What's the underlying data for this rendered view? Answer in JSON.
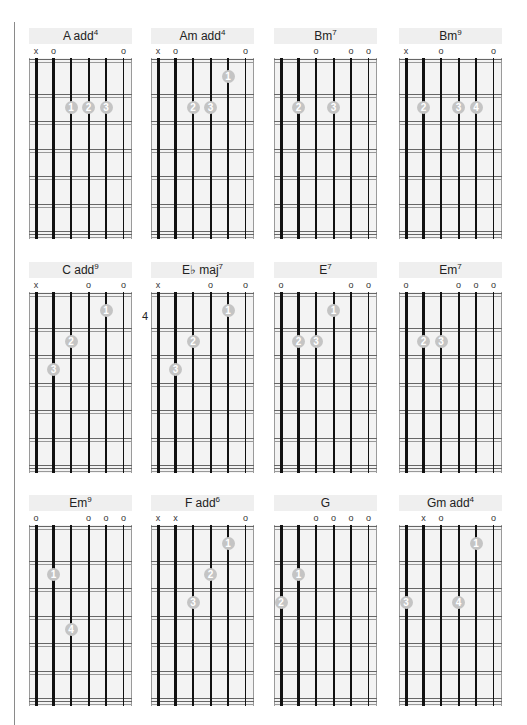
{
  "page": {
    "layout": {
      "cols_x": [
        29,
        151,
        274,
        399
      ],
      "rows_y": [
        28,
        262,
        495
      ]
    },
    "colors": {
      "board": "#f3f3f3",
      "title_bg": "#efefef",
      "dot": "#c4c4c4",
      "string": "#111111"
    }
  },
  "chords": [
    {
      "name": "A add",
      "sup": "4",
      "markers": [
        "x",
        "o",
        "",
        "",
        "",
        "o"
      ],
      "dots": [
        {
          "s": 2,
          "f": 2,
          "n": "1"
        },
        {
          "s": 3,
          "f": 2,
          "n": "2"
        },
        {
          "s": 4,
          "f": 2,
          "n": "3"
        }
      ]
    },
    {
      "name": "Am add",
      "sup": "4",
      "markers": [
        "x",
        "o",
        "",
        "",
        "",
        "o"
      ],
      "dots": [
        {
          "s": 4,
          "f": 1,
          "n": "1"
        },
        {
          "s": 2,
          "f": 2,
          "n": "2"
        },
        {
          "s": 3,
          "f": 2,
          "n": "3"
        }
      ]
    },
    {
      "name": "Bm",
      "sup": "7",
      "markers": [
        "",
        "",
        "o",
        "",
        "o",
        "o"
      ],
      "dots": [
        {
          "s": 1,
          "f": 2,
          "n": "2"
        },
        {
          "s": 3,
          "f": 2,
          "n": "3"
        }
      ]
    },
    {
      "name": "Bm",
      "sup": "9",
      "markers": [
        "x",
        "",
        "o",
        "",
        "",
        "o"
      ],
      "dots": [
        {
          "s": 1,
          "f": 2,
          "n": "2"
        },
        {
          "s": 3,
          "f": 2,
          "n": "3"
        },
        {
          "s": 4,
          "f": 2,
          "n": "4"
        }
      ]
    },
    {
      "name": "C add",
      "sup": "9",
      "markers": [
        "x",
        "",
        "",
        "o",
        "",
        "o"
      ],
      "dots": [
        {
          "s": 4,
          "f": 1,
          "n": "1"
        },
        {
          "s": 2,
          "f": 2,
          "n": "2"
        },
        {
          "s": 1,
          "f": 3,
          "n": "3"
        }
      ]
    },
    {
      "name": "E♭ maj",
      "sup": "7",
      "position": "4",
      "markers": [
        "x",
        "",
        "",
        "o",
        "",
        "o"
      ],
      "dots": [
        {
          "s": 4,
          "f": 1,
          "n": "1"
        },
        {
          "s": 2,
          "f": 2,
          "n": "2"
        },
        {
          "s": 1,
          "f": 3,
          "n": "3"
        }
      ]
    },
    {
      "name": "E",
      "sup": "7",
      "markers": [
        "o",
        "",
        "",
        "",
        "o",
        "o"
      ],
      "dots": [
        {
          "s": 3,
          "f": 1,
          "n": "1"
        },
        {
          "s": 1,
          "f": 2,
          "n": "2"
        },
        {
          "s": 2,
          "f": 2,
          "n": "3"
        }
      ]
    },
    {
      "name": "Em",
      "sup": "7",
      "markers": [
        "o",
        "",
        "",
        "o",
        "o",
        "o"
      ],
      "dots": [
        {
          "s": 1,
          "f": 2,
          "n": "2"
        },
        {
          "s": 2,
          "f": 2,
          "n": "3"
        }
      ]
    },
    {
      "name": "Em",
      "sup": "9",
      "markers": [
        "o",
        "",
        "",
        "o",
        "o",
        "o"
      ],
      "dots": [
        {
          "s": 1,
          "f": 2,
          "n": "1"
        },
        {
          "s": 2,
          "f": 4,
          "n": "4"
        }
      ]
    },
    {
      "name": "F add",
      "sup": "6",
      "markers": [
        "x",
        "x",
        "",
        "",
        "",
        "o"
      ],
      "dots": [
        {
          "s": 4,
          "f": 1,
          "n": "1"
        },
        {
          "s": 3,
          "f": 2,
          "n": "2"
        },
        {
          "s": 2,
          "f": 3,
          "n": "3"
        }
      ]
    },
    {
      "name": "G",
      "sup": "",
      "markers": [
        "",
        "",
        "o",
        "o",
        "o",
        "o"
      ],
      "dots": [
        {
          "s": 1,
          "f": 2,
          "n": "1"
        },
        {
          "s": 0,
          "f": 3,
          "n": "2"
        }
      ]
    },
    {
      "name": "Gm add",
      "sup": "4",
      "markers": [
        "",
        "x",
        "o",
        "",
        "",
        "o"
      ],
      "dots": [
        {
          "s": 4,
          "f": 1,
          "n": "1"
        },
        {
          "s": 0,
          "f": 3,
          "n": "3"
        },
        {
          "s": 3,
          "f": 3,
          "n": "4"
        }
      ]
    }
  ]
}
